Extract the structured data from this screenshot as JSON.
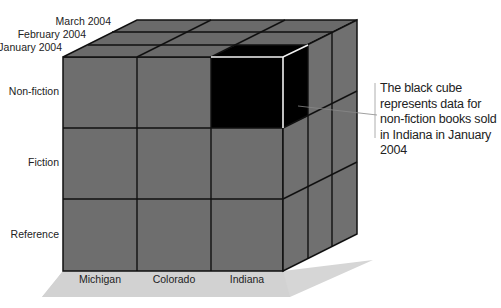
{
  "diagram": {
    "type": "olap-data-cube",
    "dimensions": {
      "time": [
        "January 2004",
        "February 2004",
        "March 2004"
      ],
      "category": [
        "Non-fiction",
        "Fiction",
        "Reference"
      ],
      "state": [
        "Michigan",
        "Colorado",
        "Indiana"
      ]
    },
    "highlighted_cell": {
      "category": "Non-fiction",
      "state": "Indiana",
      "time": "January 2004"
    },
    "annotation": "The black cube represents data for non-fiction books sold in Indiana in January 2004",
    "colors": {
      "cube": "#6b6b6b",
      "highlight": "#000000",
      "shadow": "#d4d4d4",
      "grid": "#111111"
    }
  },
  "labels": {
    "time": [
      "January 2004",
      "February 2004",
      "March 2004"
    ],
    "rows": [
      "Non-fiction",
      "Fiction",
      "Reference"
    ],
    "cols": [
      "Michigan",
      "Colorado",
      "Indiana"
    ]
  }
}
